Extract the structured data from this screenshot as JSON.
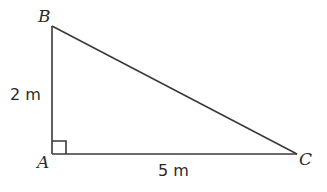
{
  "diagram": {
    "type": "right-triangle",
    "vertices": {
      "A": {
        "label": "A",
        "right_angle": true
      },
      "B": {
        "label": "B"
      },
      "C": {
        "label": "C"
      }
    },
    "sides": {
      "AB": {
        "label": "2 m"
      },
      "AC": {
        "label": "5 m"
      }
    },
    "colors": {
      "stroke": "#3a3a3a",
      "background": "#ffffff"
    }
  }
}
